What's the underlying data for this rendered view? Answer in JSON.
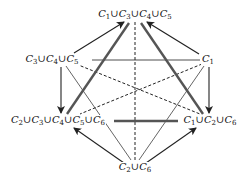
{
  "diagram": {
    "nodes": [
      {
        "id": "top",
        "label": "C1 ∪ C3 ∪ C4 ∪ C5",
        "x": 135,
        "y": 15
      },
      {
        "id": "upper_left",
        "label": "C3 ∪ C4 ∪ C5",
        "x": 52,
        "y": 60
      },
      {
        "id": "upper_right",
        "label": "C1",
        "x": 208,
        "y": 60
      },
      {
        "id": "lower_left",
        "label": "C2 ∪ C3 ∪ C4 ∪ C5 ∪ C6",
        "x": 58,
        "y": 121
      },
      {
        "id": "lower_right",
        "label": "C1 ∪ C2 ∪ C6",
        "x": 210,
        "y": 121
      },
      {
        "id": "bottom",
        "label": "C2 ∪ C6",
        "x": 135,
        "y": 168
      }
    ],
    "edges": [
      {
        "from": "upper_left",
        "to": "top",
        "style": "arrow"
      },
      {
        "from": "upper_right",
        "to": "top",
        "style": "arrow"
      },
      {
        "from": "top",
        "to": "lower_left",
        "style": "thick"
      },
      {
        "from": "top",
        "to": "lower_right",
        "style": "thick"
      },
      {
        "from": "top",
        "to": "bottom",
        "style": "dashed"
      },
      {
        "from": "upper_left",
        "to": "upper_right",
        "style": "thin"
      },
      {
        "from": "upper_left",
        "to": "lower_right",
        "style": "dashed"
      },
      {
        "from": "upper_right",
        "to": "lower_left",
        "style": "dashed"
      },
      {
        "from": "upper_left",
        "to": "lower_left",
        "style": "arrow"
      },
      {
        "from": "upper_right",
        "to": "lower_right",
        "style": "arrow"
      },
      {
        "from": "upper_left",
        "to": "bottom",
        "style": "thin"
      },
      {
        "from": "upper_right",
        "to": "bottom",
        "style": "thin"
      },
      {
        "from": "lower_left",
        "to": "lower_right",
        "style": "thick"
      },
      {
        "from": "bottom",
        "to": "lower_left",
        "style": "arrow"
      },
      {
        "from": "bottom",
        "to": "lower_right",
        "style": "arrow"
      }
    ],
    "colors": {
      "line": "#222222",
      "thick": "#555555"
    }
  }
}
